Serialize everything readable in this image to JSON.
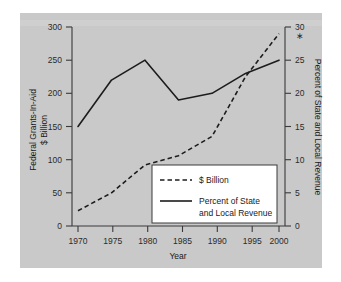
{
  "chart_data": {
    "type": "line",
    "title": "",
    "xlabel": "Year",
    "ylabel": "Federal Grants-In-Aid $ Billion",
    "y2label": "Percent of State and Local Revenue",
    "x": [
      1970,
      1975,
      1980,
      1985,
      1990,
      1995,
      2000
    ],
    "xlim": [
      1968,
      2001
    ],
    "ylim": [
      0,
      300
    ],
    "y2lim": [
      0,
      30
    ],
    "grid": false,
    "legend_position": "inside-lower-right",
    "series": [
      {
        "name": "$ Billion",
        "axis": "left",
        "style": "dashed",
        "values": [
          23,
          50,
          92,
          106,
          135,
          225,
          290
        ]
      },
      {
        "name": "Percent of State and Local Revenue",
        "axis": "right",
        "style": "solid",
        "values": [
          15.0,
          22.0,
          25.0,
          19.0,
          20.0,
          23.0,
          25.0
        ]
      }
    ],
    "annotations": [
      {
        "name": "right-axis-asterisk",
        "text": "∗",
        "near": "30"
      }
    ]
  },
  "axes": {
    "left": {
      "title_line1": "Federal Grants-In-Aid",
      "title_line2": "$ Billion",
      "ticks": [
        "0",
        "50",
        "100",
        "150",
        "200",
        "250",
        "300"
      ]
    },
    "right": {
      "title": "Percent of State and Local Revenue",
      "ticks": [
        "0",
        "5",
        "10",
        "15",
        "20",
        "25",
        "30"
      ]
    },
    "bottom": {
      "title": "Year",
      "ticks": [
        "1970",
        "1975",
        "1980",
        "1985",
        "1990",
        "1995",
        "2000"
      ]
    }
  },
  "legend": {
    "entries": [
      {
        "label": "$ Billion",
        "style": "dashed"
      },
      {
        "label_line1": "Percent of State",
        "label_line2": "and Local Revenue",
        "style": "solid"
      }
    ]
  },
  "colors": {
    "panel_background": "#c9c9c9",
    "page_background": "#ffffff",
    "ink": "#1c1c1c",
    "axis": "#3a3a3a",
    "legend_background": "#ffffff"
  }
}
